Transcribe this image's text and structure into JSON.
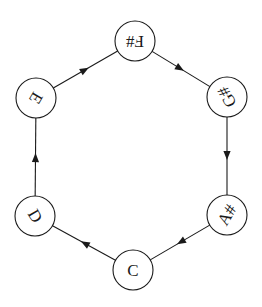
{
  "diagram": {
    "type": "directed-cycle",
    "colors": {
      "stroke": "#1a1a1a",
      "fill": "#ffffff",
      "text": "#1a1a1a"
    },
    "node_radius": 20,
    "center": {
      "x": 131,
      "y": 156
    },
    "nodes": [
      {
        "id": "fsharp",
        "label": "F#",
        "x": 135,
        "y": 41,
        "rotation": 180
      },
      {
        "id": "gsharp",
        "label": "G#",
        "x": 227,
        "y": 97,
        "rotation": 240
      },
      {
        "id": "asharp",
        "label": "A#",
        "x": 227,
        "y": 215,
        "rotation": 300
      },
      {
        "id": "c",
        "label": "C",
        "x": 133,
        "y": 270,
        "rotation": 0
      },
      {
        "id": "d",
        "label": "D",
        "x": 35,
        "y": 216,
        "rotation": 60
      },
      {
        "id": "e",
        "label": "E",
        "x": 36,
        "y": 98,
        "rotation": 120
      }
    ],
    "edges": [
      {
        "from": "fsharp",
        "to": "gsharp"
      },
      {
        "from": "gsharp",
        "to": "asharp"
      },
      {
        "from": "asharp",
        "to": "c"
      },
      {
        "from": "c",
        "to": "d"
      },
      {
        "from": "d",
        "to": "e"
      },
      {
        "from": "e",
        "to": "fsharp"
      }
    ]
  }
}
